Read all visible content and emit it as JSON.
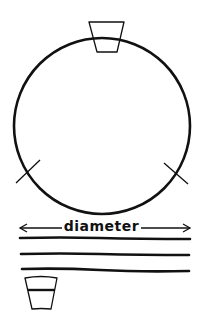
{
  "diagram": {
    "type": "hand-drawn measurement illustration",
    "stroke_color": "#111111",
    "background": "#ffffff",
    "circle": {
      "cx": 102,
      "cy": 126,
      "r": 88
    },
    "top_cup": {
      "top_left": [
        89,
        22
      ],
      "top_right": [
        124,
        22
      ],
      "bottom_right": [
        117,
        52
      ],
      "bottom_left": [
        97,
        52
      ]
    },
    "markers": [
      {
        "name": "left-mark",
        "from": [
          16,
          183
        ],
        "to": [
          40,
          160
        ]
      },
      {
        "name": "right-mark",
        "from": [
          164,
          163
        ],
        "to": [
          188,
          184
        ]
      }
    ],
    "dimension": {
      "label": "diameter",
      "x1": 20,
      "x2": 190,
      "y": 228
    },
    "strands_y": [
      238,
      254,
      269
    ],
    "bottom_cup": {
      "top_left": [
        25,
        277
      ],
      "top_right": [
        57,
        277
      ],
      "bottom_right": [
        51,
        309
      ],
      "bottom_left": [
        32,
        309
      ],
      "band_y": 290
    }
  }
}
